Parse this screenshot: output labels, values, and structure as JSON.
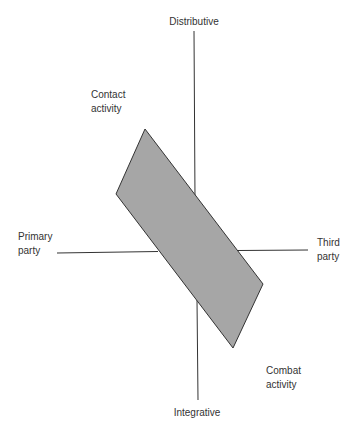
{
  "diagram": {
    "axes": {
      "top": "Distributive",
      "bottom": "Integrative",
      "left": [
        "Primary",
        "party"
      ],
      "right": [
        "Third",
        "party"
      ]
    },
    "regions": {
      "upper_left": [
        "Contact",
        "activity"
      ],
      "lower_right": [
        "Combat",
        "activity"
      ]
    },
    "shape": {
      "type": "parallelogram",
      "fill": "#a6a6a6",
      "stroke": "#333333",
      "points": [
        [
          145,
          129
        ],
        [
          263,
          284
        ],
        [
          233,
          348
        ],
        [
          116,
          194
        ]
      ]
    },
    "colors": {
      "line": "#333333",
      "text": "#333333",
      "background": "#ffffff"
    }
  }
}
